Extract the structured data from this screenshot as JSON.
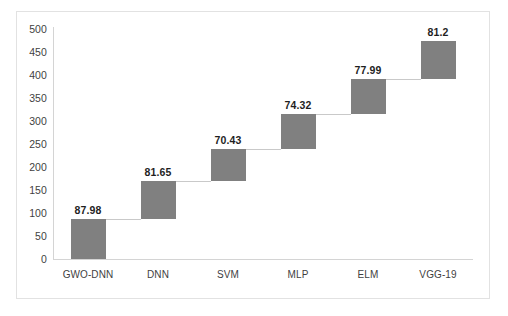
{
  "chart_data": {
    "type": "bar",
    "subtype": "waterfall",
    "title": "",
    "xlabel": "",
    "ylabel": "",
    "categories": [
      "GWO-DNN",
      "DNN",
      "SVM",
      "MLP",
      "ELM",
      "VGG-19"
    ],
    "values": [
      87.98,
      81.65,
      70.43,
      74.32,
      77.99,
      81.2
    ],
    "bases": [
      0,
      87.98,
      169.63,
      240.06,
      314.38,
      392.37
    ],
    "tops": [
      87.98,
      169.63,
      240.06,
      314.38,
      392.37,
      473.57
    ],
    "data_labels": [
      "87.98",
      "81.65",
      "70.43",
      "74.32",
      "77.99",
      "81.2"
    ],
    "ylim": [
      0,
      500
    ],
    "ytick_step": 50,
    "ytick_labels": [
      "500",
      "450",
      "400",
      "350",
      "300",
      "250",
      "200",
      "150",
      "100",
      "50",
      "0"
    ],
    "ytick_values": [
      500,
      450,
      400,
      350,
      300,
      250,
      200,
      150,
      100,
      50,
      0
    ],
    "grid": false,
    "legend": null,
    "series_color": "#808080",
    "connector_color": "#c9c9c9",
    "axis_color": "#d4d4d4",
    "frame_color": "#e2e2e2",
    "background": "#ffffff"
  }
}
